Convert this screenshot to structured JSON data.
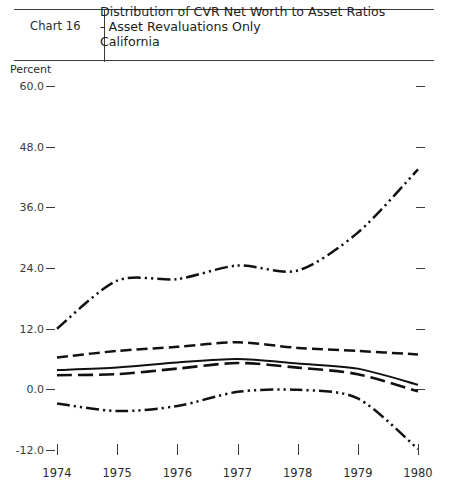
{
  "header": {
    "chart_number": "Chart 16",
    "title_line1": "Distribution of CVR Net Worth to Asset Ratios",
    "title_line2": "- Asset Revaluations Only",
    "title_line3": "California"
  },
  "axis": {
    "y_unit_label": "Percent",
    "y_ticks": [
      "60.0",
      "48.0",
      "36.0",
      "24.0",
      "12.0",
      "0.0",
      "-12.0"
    ],
    "x_ticks": [
      "1974",
      "1975",
      "1976",
      "1977",
      "1978",
      "1979",
      "1980"
    ]
  },
  "colors": {
    "ink": "#111111",
    "rule": "#3a3a3a",
    "background": "#ffffff"
  },
  "chart_data": {
    "type": "line",
    "subtitle": "Chart 16",
    "xlabel": "",
    "ylabel": "Percent",
    "x": [
      1974,
      1975,
      1976,
      1977,
      1978,
      1979,
      1980
    ],
    "xlim": [
      1974,
      1980
    ],
    "ylim": [
      -12.0,
      60.0
    ],
    "grid": false,
    "legend": "none",
    "series": [
      {
        "name": "95th percentile",
        "style": "dash-dot-dot",
        "values": [
          12.0,
          21.5,
          21.8,
          24.5,
          23.5,
          31.0,
          43.5
        ]
      },
      {
        "name": "75th percentile",
        "style": "dashed",
        "values": [
          6.3,
          7.6,
          8.4,
          9.3,
          8.2,
          7.6,
          6.9
        ]
      },
      {
        "name": "Median",
        "style": "solid",
        "values": [
          3.8,
          4.3,
          5.3,
          6.0,
          5.1,
          4.1,
          0.9
        ]
      },
      {
        "name": "25th percentile",
        "style": "dashed-long",
        "values": [
          2.8,
          3.0,
          4.1,
          5.2,
          4.3,
          3.0,
          -0.4
        ]
      },
      {
        "name": "5th percentile",
        "style": "dash-dot-dot",
        "values": [
          -2.8,
          -4.3,
          -3.3,
          -0.5,
          -0.1,
          -1.8,
          -11.8
        ]
      }
    ]
  }
}
